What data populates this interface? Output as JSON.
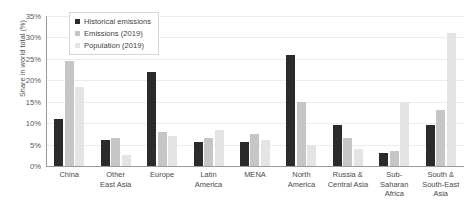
{
  "chart_data": {
    "type": "bar",
    "title": "",
    "xlabel": "",
    "ylabel": "Share in world total (%)",
    "ylim": [
      0,
      35
    ],
    "ytick_labels": [
      "35%",
      "30%",
      "25%",
      "20%",
      "15%",
      "10%",
      "5%",
      "0%"
    ],
    "ytick_values": [
      35,
      30,
      25,
      20,
      15,
      10,
      5,
      0
    ],
    "grid": true,
    "legend_position": "top-left-inside",
    "categories": [
      "China",
      "Other\nEast Asia",
      "Europe",
      "Latin\nAmerica",
      "MENA",
      "North\nAmerica",
      "Russia &\nCentral Asia",
      "Sub-\nSaharan\nAfrica",
      "South &\nSouth-East\nAsia"
    ],
    "series": [
      {
        "name": "Historical emissions",
        "color": "#2b2b2b",
        "values": [
          11.0,
          6.0,
          22.0,
          5.5,
          5.5,
          26.0,
          9.5,
          3.0,
          9.5
        ]
      },
      {
        "name": "Emissions (2019)",
        "color": "#c6c6c6",
        "values": [
          24.5,
          6.5,
          8.0,
          6.5,
          7.5,
          15.0,
          6.5,
          3.5,
          13.0
        ]
      },
      {
        "name": "Population (2019)",
        "color": "#e4e4e4",
        "values": [
          18.5,
          2.5,
          7.0,
          8.3,
          6.0,
          5.0,
          4.0,
          15.0,
          31.0
        ]
      }
    ]
  }
}
